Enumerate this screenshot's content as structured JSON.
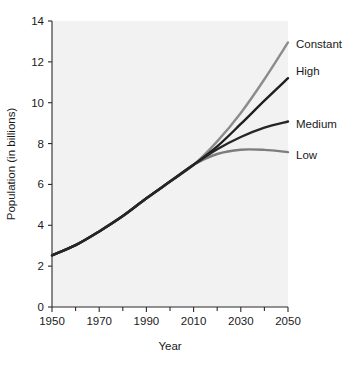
{
  "chart_data": {
    "type": "line",
    "title": "",
    "xlabel": "Year",
    "ylabel": "Population (in billions)",
    "xlim": [
      1950,
      2050
    ],
    "ylim": [
      0,
      14
    ],
    "grid": false,
    "legend_position": "right-inline-labels",
    "x_ticks": [
      1950,
      1970,
      1990,
      2010,
      2030,
      2050
    ],
    "x_tick_labels": [
      "1950",
      "1970",
      "1990",
      "2010",
      "2030",
      "2050"
    ],
    "x_minor_ticks": [
      1960,
      1980,
      2000,
      2020,
      2040
    ],
    "y_ticks": [
      0,
      2,
      4,
      6,
      8,
      10,
      12,
      14
    ],
    "y_tick_labels": [
      "0",
      "2",
      "4",
      "6",
      "8",
      "10",
      "12",
      "14"
    ],
    "x": [
      1950,
      1960,
      1970,
      1980,
      1990,
      2000,
      2010,
      2020,
      2030,
      2040,
      2050
    ],
    "series": [
      {
        "name": "Constant",
        "label": "Constant",
        "color": "#8c8c8c",
        "values": [
          2.53,
          3.03,
          3.7,
          4.45,
          5.32,
          6.14,
          6.96,
          8.11,
          9.5,
          11.15,
          12.95
        ]
      },
      {
        "name": "High",
        "label": "High",
        "color": "#1f1f1f",
        "values": [
          2.53,
          3.03,
          3.7,
          4.45,
          5.32,
          6.14,
          6.96,
          7.86,
          8.96,
          10.1,
          11.2
        ]
      },
      {
        "name": "Medium",
        "label": "Medium",
        "color": "#262626",
        "values": [
          2.53,
          3.03,
          3.7,
          4.45,
          5.32,
          6.14,
          6.96,
          7.72,
          8.32,
          8.78,
          9.08
        ]
      },
      {
        "name": "Low",
        "label": "Low",
        "color": "#7d7d7d",
        "values": [
          2.53,
          3.03,
          3.7,
          4.45,
          5.32,
          6.14,
          6.96,
          7.49,
          7.7,
          7.69,
          7.58
        ]
      }
    ]
  },
  "axes": {
    "x_title": "Year",
    "y_title": "Population (in billions)"
  }
}
